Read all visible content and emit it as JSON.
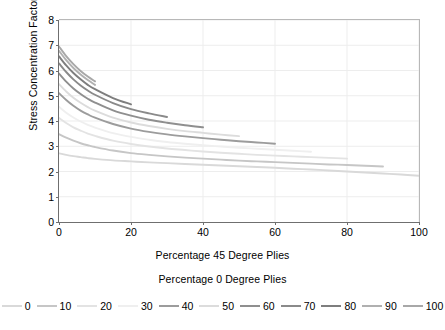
{
  "chart_data": {
    "type": "line",
    "title": "",
    "xlabel": "Percentage 45 Degree Plies",
    "xlabel2": "Percentage 0 Degree Plies",
    "ylabel": "Stress Concentration Factor",
    "xlim": [
      0,
      100
    ],
    "ylim": [
      0,
      8
    ],
    "xticks": [
      0,
      20,
      40,
      60,
      80,
      100
    ],
    "yticks": [
      0,
      1,
      2,
      3,
      4,
      5,
      6,
      7,
      8
    ],
    "grid": true,
    "legend_position": "bottom",
    "legend_title": "Percentage 0 Degree Plies",
    "series": [
      {
        "name": "0",
        "color": "#d9d9d9",
        "x": [
          0,
          2,
          4,
          6,
          8,
          10,
          15,
          20,
          25,
          30,
          35,
          40,
          45,
          50,
          55,
          60,
          65,
          70,
          75,
          80,
          85,
          90,
          95,
          100
        ],
        "y": [
          2.72,
          2.66,
          2.61,
          2.57,
          2.53,
          2.5,
          2.44,
          2.4,
          2.36,
          2.33,
          2.3,
          2.27,
          2.24,
          2.21,
          2.18,
          2.15,
          2.11,
          2.08,
          2.04,
          2.0,
          1.96,
          1.92,
          1.88,
          1.83
        ]
      },
      {
        "name": "10",
        "color": "#c6c6c6",
        "x": [
          0,
          2,
          4,
          6,
          8,
          10,
          15,
          20,
          25,
          30,
          35,
          40,
          45,
          50,
          55,
          60,
          65,
          70,
          75,
          80,
          85,
          90
        ],
        "y": [
          3.48,
          3.34,
          3.22,
          3.12,
          3.04,
          2.97,
          2.83,
          2.73,
          2.66,
          2.6,
          2.55,
          2.51,
          2.47,
          2.43,
          2.4,
          2.37,
          2.34,
          2.31,
          2.28,
          2.26,
          2.23,
          2.2
        ]
      },
      {
        "name": "20",
        "color": "#e3e3e3",
        "x": [
          0,
          2,
          4,
          6,
          8,
          10,
          15,
          20,
          25,
          30,
          35,
          40,
          45,
          50,
          55,
          60,
          65,
          70,
          75,
          80
        ],
        "y": [
          4.12,
          3.92,
          3.75,
          3.62,
          3.5,
          3.41,
          3.22,
          3.09,
          2.99,
          2.91,
          2.85,
          2.79,
          2.74,
          2.7,
          2.66,
          2.63,
          2.6,
          2.57,
          2.54,
          2.51
        ]
      },
      {
        "name": "30",
        "color": "#efefef",
        "x": [
          0,
          2,
          4,
          6,
          8,
          10,
          15,
          20,
          25,
          30,
          35,
          40,
          45,
          50,
          55,
          60,
          65,
          70
        ],
        "y": [
          4.56,
          4.33,
          4.14,
          3.98,
          3.85,
          3.74,
          3.52,
          3.37,
          3.26,
          3.17,
          3.1,
          3.04,
          2.99,
          2.94,
          2.9,
          2.86,
          2.82,
          2.78
        ]
      },
      {
        "name": "40",
        "color": "#9c9c9c",
        "x": [
          0,
          2,
          4,
          6,
          8,
          10,
          15,
          20,
          25,
          30,
          35,
          40,
          45,
          50,
          55,
          60
        ],
        "y": [
          5.1,
          4.83,
          4.6,
          4.41,
          4.26,
          4.13,
          3.88,
          3.7,
          3.57,
          3.47,
          3.39,
          3.32,
          3.26,
          3.2,
          3.15,
          3.1
        ]
      },
      {
        "name": "50",
        "color": "#dcdcdc",
        "x": [
          0,
          2,
          4,
          6,
          8,
          10,
          15,
          20,
          25,
          30,
          35,
          40,
          45,
          50
        ],
        "y": [
          5.46,
          5.17,
          4.92,
          4.72,
          4.55,
          4.41,
          4.13,
          3.94,
          3.8,
          3.69,
          3.6,
          3.53,
          3.46,
          3.4
        ]
      },
      {
        "name": "60",
        "color": "#8f8f8f",
        "x": [
          0,
          2,
          4,
          6,
          8,
          10,
          15,
          20,
          25,
          30,
          35,
          40
        ],
        "y": [
          5.88,
          5.56,
          5.29,
          5.07,
          4.88,
          4.73,
          4.42,
          4.21,
          4.05,
          3.93,
          3.83,
          3.75
        ]
      },
      {
        "name": "70",
        "color": "#8a8a8a",
        "x": [
          0,
          2,
          4,
          6,
          8,
          10,
          15,
          20,
          25,
          30
        ],
        "y": [
          6.28,
          5.94,
          5.65,
          5.41,
          5.21,
          5.04,
          4.71,
          4.47,
          4.3,
          4.16
        ]
      },
      {
        "name": "80",
        "color": "#7e7e7e",
        "x": [
          0,
          2,
          4,
          6,
          8,
          10,
          15,
          20
        ],
        "y": [
          6.56,
          6.2,
          5.9,
          5.65,
          5.43,
          5.26,
          4.91,
          4.66
        ]
      },
      {
        "name": "90",
        "color": "#b0b0b0",
        "x": [
          0,
          2,
          4,
          6,
          8,
          10
        ],
        "y": [
          6.78,
          6.41,
          6.1,
          5.84,
          5.62,
          5.43
        ]
      },
      {
        "name": "100",
        "color": "#a8a8a8",
        "x": [
          0,
          2,
          4,
          6,
          8,
          10
        ],
        "y": [
          6.95,
          6.57,
          6.25,
          5.98,
          5.76,
          5.57
        ]
      }
    ]
  },
  "axis": {
    "y_title": "Stress Concentration Factor",
    "x_title": "Percentage 45 Degree Plies",
    "legend_title": "Percentage 0 Degree Plies",
    "yticks": [
      "0",
      "1",
      "2",
      "3",
      "4",
      "5",
      "6",
      "7",
      "8"
    ],
    "xticks": [
      "0",
      "20",
      "40",
      "60",
      "80",
      "100"
    ]
  },
  "colors": {
    "axis_line": "#6f6f6f",
    "frame_line": "#b8b8b8",
    "grid_line": "#ededed",
    "text": "#000000",
    "background": "#ffffff"
  }
}
